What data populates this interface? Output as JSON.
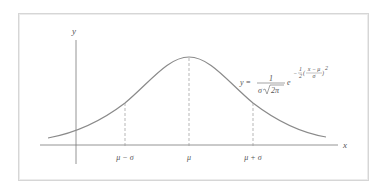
{
  "diagram": {
    "axes": {
      "x_label": "x",
      "y_label": "y"
    },
    "ticks": [
      {
        "label": "μ − σ",
        "x": 125
      },
      {
        "label": "μ",
        "x": 189
      },
      {
        "label": "μ + σ",
        "x": 253
      }
    ],
    "formula": {
      "lhs": "y =",
      "numerator": "1",
      "denominator_sigma": "σ",
      "denominator_root": "2π",
      "base": "e",
      "exp_sign": "−",
      "exp_frac_num": "1",
      "exp_frac_den": "2",
      "exp_inner_num": "x − μ",
      "exp_inner_den": "σ",
      "exp_power": "2"
    },
    "colors": {
      "curve": "#8a8a8a",
      "axis": "#7a7a7a",
      "dashed": "#9a9a9a",
      "frame": "#d6d6d6",
      "text": "#555555"
    }
  }
}
